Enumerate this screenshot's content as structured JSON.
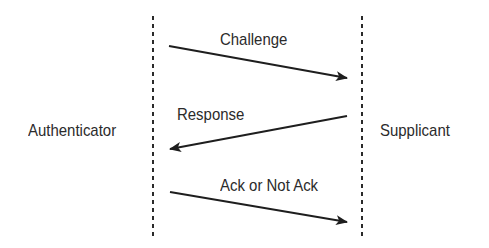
{
  "diagram": {
    "type": "sequence",
    "participants": [
      {
        "id": "authenticator",
        "label": "Authenticator"
      },
      {
        "id": "supplicant",
        "label": "Supplicant"
      }
    ],
    "messages": [
      {
        "from": "authenticator",
        "to": "supplicant",
        "label": "Challenge"
      },
      {
        "from": "supplicant",
        "to": "authenticator",
        "label": "Response"
      },
      {
        "from": "authenticator",
        "to": "supplicant",
        "label": "Ack or Not Ack"
      }
    ],
    "colors": {
      "line": "#1e1e1e",
      "text": "#2b2b2b",
      "background": "#ffffff"
    }
  }
}
